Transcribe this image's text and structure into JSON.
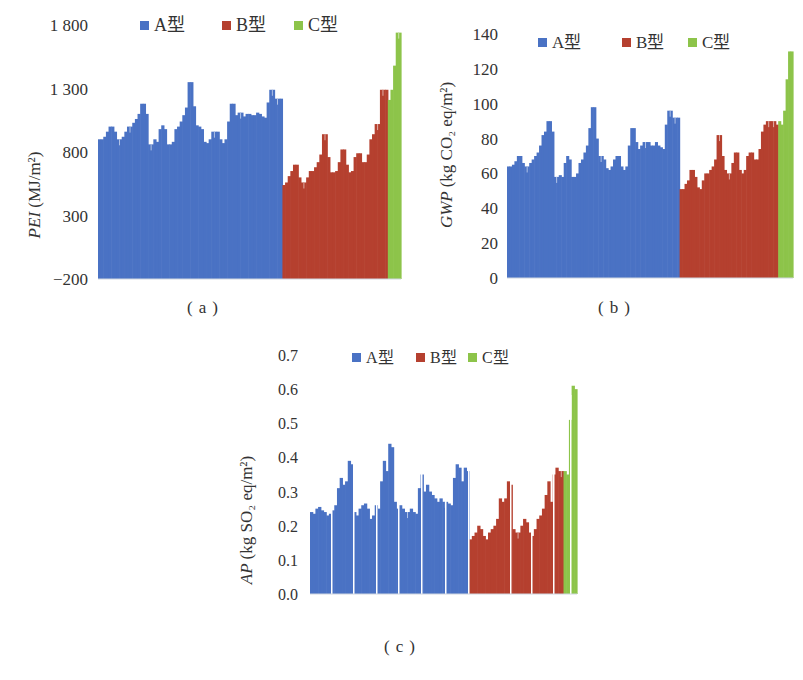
{
  "colors": {
    "A": "#4a72c4",
    "B": "#b5402f",
    "C": "#8dc44a"
  },
  "legend": [
    {
      "key": "A",
      "label": "A型"
    },
    {
      "key": "B",
      "label": "B型"
    },
    {
      "key": "C",
      "label": "C型"
    }
  ],
  "captions": {
    "a": "(a)",
    "b": "(b)",
    "c": "(c)"
  },
  "chart_data": [
    {
      "id": "a",
      "type": "bar",
      "title": "",
      "xlabel": "",
      "ylabel": "PEI (MJ/m²)",
      "ylim": [
        -200,
        1800
      ],
      "yticks": [
        -200,
        300,
        800,
        1300,
        1800
      ],
      "ytick_labels": [
        "−200",
        "300",
        "800",
        "1 300",
        "1 800"
      ],
      "grid": false,
      "legend_position": "top",
      "series": [
        {
          "name": "A型",
          "values": [
            900,
            900,
            920,
            960,
            1000,
            1000,
            960,
            900,
            900,
            920,
            960,
            1000,
            1000,
            1030,
            1060,
            1100,
            1180,
            1180,
            1100,
            860,
            860,
            900,
            880,
            980,
            1010,
            980,
            860,
            860,
            880,
            980,
            1000,
            1040,
            1090,
            1150,
            1350,
            1350,
            1160,
            1010,
            1000,
            980,
            880,
            870,
            900,
            960,
            960,
            960,
            900,
            870,
            900,
            1040,
            1180,
            1180,
            1090,
            1110,
            1110,
            1080,
            1100,
            1100,
            1090,
            1090,
            1110,
            1100,
            1080,
            1070,
            1190,
            1290,
            1290,
            1220,
            1220,
            1220
          ]
        },
        {
          "name": "B型",
          "values": [
            540,
            560,
            610,
            650,
            700,
            700,
            600,
            560,
            560,
            600,
            650,
            650,
            680,
            720,
            780,
            940,
            940,
            760,
            640,
            640,
            650,
            720,
            820,
            820,
            700,
            640,
            650,
            760,
            790,
            790,
            720,
            720,
            780,
            900,
            940,
            1020,
            1020,
            1290,
            1290,
            1290
          ]
        },
        {
          "name": "C型",
          "values": [
            1210,
            1290,
            1480,
            1740,
            1740
          ]
        }
      ]
    },
    {
      "id": "b",
      "type": "bar",
      "title": "",
      "xlabel": "",
      "ylabel": "GWP (kg CO₂ eq/m²)",
      "ylim": [
        0,
        140
      ],
      "yticks": [
        0,
        20,
        40,
        60,
        80,
        100,
        120,
        140
      ],
      "ytick_labels": [
        "0",
        "20",
        "40",
        "60",
        "80",
        "100",
        "120",
        "140"
      ],
      "grid": false,
      "legend_position": "top",
      "series": [
        {
          "name": "A型",
          "values": [
            64,
            64,
            65,
            67,
            70,
            70,
            66,
            64,
            64,
            66,
            68,
            70,
            72,
            76,
            82,
            84,
            90,
            90,
            84,
            58,
            58,
            59,
            58,
            66,
            70,
            68,
            58,
            58,
            60,
            66,
            68,
            72,
            76,
            86,
            98,
            98,
            80,
            70,
            70,
            68,
            63,
            62,
            64,
            68,
            70,
            70,
            64,
            62,
            64,
            76,
            86,
            86,
            78,
            74,
            76,
            78,
            78,
            78,
            76,
            76,
            78,
            76,
            75,
            74,
            88,
            96,
            96,
            92,
            92,
            92
          ]
        },
        {
          "name": "B型",
          "values": [
            51,
            51,
            54,
            56,
            62,
            62,
            58,
            52,
            51,
            56,
            60,
            60,
            62,
            64,
            68,
            82,
            82,
            70,
            62,
            60,
            60,
            66,
            72,
            72,
            62,
            60,
            62,
            70,
            72,
            72,
            68,
            68,
            74,
            84,
            88,
            90,
            90,
            90,
            90,
            88
          ]
        },
        {
          "name": "C型",
          "values": [
            90,
            88,
            96,
            114,
            130,
            130
          ]
        }
      ]
    },
    {
      "id": "c",
      "type": "bar",
      "title": "",
      "xlabel": "",
      "ylabel": "AP (kg SO₂ eq/m²)",
      "ylim": [
        0.0,
        0.7
      ],
      "yticks": [
        0.0,
        0.1,
        0.2,
        0.3,
        0.4,
        0.5,
        0.6,
        0.7
      ],
      "ytick_labels": [
        "0.0",
        "0.1",
        "0.2",
        "0.3",
        "0.4",
        "0.5",
        "0.6",
        "0.7"
      ],
      "grid": false,
      "legend_position": "top",
      "series": [
        {
          "name": "A型",
          "values": [
            0.24,
            0.235,
            0.25,
            0.255,
            0.245,
            0.24,
            0.23,
            0.235,
            0.245,
            0.26,
            0.31,
            0.34,
            0.32,
            0.33,
            0.39,
            0.38,
            0.24,
            0.23,
            0.25,
            0.26,
            0.265,
            0.25,
            0.22,
            0.23,
            0.26,
            0.25,
            0.33,
            0.39,
            0.36,
            0.44,
            0.43,
            0.27,
            0.25,
            0.26,
            0.25,
            0.24,
            0.24,
            0.25,
            0.24,
            0.235,
            0.31,
            0.35,
            0.3,
            0.32,
            0.3,
            0.29,
            0.28,
            0.27,
            0.28,
            0.27,
            0.27,
            0.265,
            0.26,
            0.34,
            0.38,
            0.37,
            0.33,
            0.37,
            0.36
          ]
        },
        {
          "name": "B型",
          "values": [
            0.16,
            0.17,
            0.18,
            0.2,
            0.19,
            0.17,
            0.16,
            0.18,
            0.19,
            0.2,
            0.22,
            0.28,
            0.27,
            0.28,
            0.33,
            0.32,
            0.19,
            0.18,
            0.18,
            0.2,
            0.22,
            0.21,
            0.18,
            0.17,
            0.19,
            0.22,
            0.23,
            0.25,
            0.29,
            0.33,
            0.27,
            0.35,
            0.37,
            0.36,
            0.36
          ]
        },
        {
          "name": "C型",
          "values": [
            0.36,
            0.35,
            0.51,
            0.61,
            0.6
          ]
        }
      ]
    }
  ]
}
